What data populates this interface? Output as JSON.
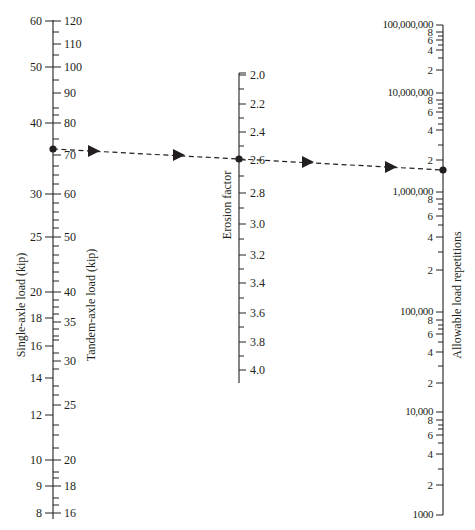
{
  "chart_data": {
    "type": "nomograph",
    "title": "",
    "caption": "",
    "axes": [
      {
        "name": "single_axle",
        "label": "Single-axle load (kip)",
        "x": 53,
        "side": "left",
        "major": [
          {
            "v": "60",
            "y": 21
          },
          {
            "v": "50",
            "y": 67
          },
          {
            "v": "40",
            "y": 123
          },
          {
            "v": "30",
            "y": 194
          },
          {
            "v": "25",
            "y": 237
          },
          {
            "v": "20",
            "y": 292
          },
          {
            "v": "18",
            "y": 318
          },
          {
            "v": "16",
            "y": 346
          },
          {
            "v": "14",
            "y": 378
          },
          {
            "v": "12",
            "y": 415
          },
          {
            "v": "10",
            "y": 460
          },
          {
            "v": "9",
            "y": 486
          },
          {
            "v": "8",
            "y": 513
          }
        ]
      },
      {
        "name": "tandem_axle",
        "label": "Tandem-axle load (kip)",
        "x": 53,
        "side": "right",
        "major": [
          {
            "v": "120",
            "y": 21
          },
          {
            "v": "110",
            "y": 44
          },
          {
            "v": "100",
            "y": 67
          },
          {
            "v": "90",
            "y": 93
          },
          {
            "v": "80",
            "y": 123
          },
          {
            "v": "70",
            "y": 155
          },
          {
            "v": "60",
            "y": 194
          },
          {
            "v": "50",
            "y": 237
          },
          {
            "v": "40",
            "y": 292
          },
          {
            "v": "35",
            "y": 322
          },
          {
            "v": "30",
            "y": 361
          },
          {
            "v": "25",
            "y": 405
          },
          {
            "v": "20",
            "y": 460
          },
          {
            "v": "18",
            "y": 486
          },
          {
            "v": "16",
            "y": 513
          }
        ],
        "minor_y": [
          32,
          55,
          80,
          108,
          115,
          139,
          166,
          175,
          184,
          203,
          212,
          220,
          228,
          246,
          255,
          263,
          272,
          281,
          300,
          307,
          314,
          329,
          336,
          340,
          353,
          369,
          386,
          395,
          425,
          435,
          448,
          472,
          478,
          498,
          505
        ]
      },
      {
        "name": "erosion_factor",
        "label": "Erosion factor",
        "x": 239,
        "y_start": 73,
        "y_end": 383,
        "side": "right",
        "major": [
          {
            "v": "2.0",
            "y": 75
          },
          {
            "v": "2.2",
            "y": 104
          },
          {
            "v": "2.4",
            "y": 132
          },
          {
            "v": "2.6",
            "y": 160
          },
          {
            "v": "2.8",
            "y": 193
          },
          {
            "v": "3.0",
            "y": 224
          },
          {
            "v": "3.2",
            "y": 255
          },
          {
            "v": "3.4",
            "y": 283
          },
          {
            "v": "3.6",
            "y": 313
          },
          {
            "v": "3.8",
            "y": 342
          },
          {
            "v": "4.0",
            "y": 370
          }
        ],
        "minor_y": [
          89,
          118,
          146,
          176,
          208,
          239,
          269,
          298,
          327,
          356
        ]
      },
      {
        "name": "allowable_repetitions",
        "label": "Allowable load repetitions",
        "x": 443,
        "y_start": 25,
        "y_end": 515,
        "side": "left",
        "major": [
          {
            "v": "100,000,000",
            "y": 25
          },
          {
            "v": "8",
            "y": 32
          },
          {
            "v": "6",
            "y": 40
          },
          {
            "v": "4",
            "y": 50
          },
          {
            "v": "2",
            "y": 70
          },
          {
            "v": "10,000,000",
            "y": 93
          },
          {
            "v": "8",
            "y": 100
          },
          {
            "v": "6",
            "y": 112
          },
          {
            "v": "4",
            "y": 130
          },
          {
            "v": "2",
            "y": 160
          },
          {
            "v": "1,000,000",
            "y": 192
          },
          {
            "v": "8",
            "y": 199
          },
          {
            "v": "6",
            "y": 216
          },
          {
            "v": "4",
            "y": 237
          },
          {
            "v": "2",
            "y": 270
          },
          {
            "v": "100,000",
            "y": 312
          },
          {
            "v": "8",
            "y": 320
          },
          {
            "v": "6",
            "y": 334
          },
          {
            "v": "4",
            "y": 352
          },
          {
            "v": "2",
            "y": 383
          },
          {
            "v": "10,000",
            "y": 412
          },
          {
            "v": "8",
            "y": 420
          },
          {
            "v": "6",
            "y": 435
          },
          {
            "v": "4",
            "y": 454
          },
          {
            "v": "2",
            "y": 485
          },
          {
            "v": "1000",
            "y": 515
          }
        ],
        "minor_y": [
          36,
          45,
          58,
          104,
          108,
          118,
          124,
          145,
          204,
          209,
          225,
          252,
          325,
          329,
          342,
          366,
          425,
          429,
          443,
          469
        ]
      }
    ],
    "example_path": {
      "description": "Dashed line with arrows: single-axle 36 kip / tandem-axle ~72 kip -> erosion factor 2.6 -> allowable repetitions ~1,500,000",
      "points": [
        {
          "axis": "single_axle",
          "x": 53,
          "y": 149,
          "value": "36"
        },
        {
          "axis": "erosion_factor",
          "x": 239,
          "y": 159,
          "value": "2.6"
        },
        {
          "axis": "allowable_repetitions",
          "x": 443,
          "y": 170,
          "value": "1,500,000"
        }
      ],
      "arrows": [
        {
          "x": 93,
          "y": 151
        },
        {
          "x": 178,
          "y": 155
        },
        {
          "x": 307,
          "y": 162
        },
        {
          "x": 390,
          "y": 167
        }
      ]
    }
  }
}
